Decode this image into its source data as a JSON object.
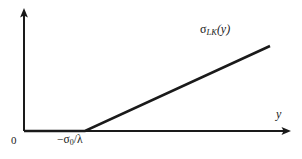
{
  "figure": {
    "background_color": "#ffffff",
    "stroke_color": "#1a1a1a",
    "width": 302,
    "height": 159
  },
  "labels": {
    "origin": "0",
    "threshold_minus": "−σ",
    "threshold_sub": "0",
    "threshold_tail": "/λ",
    "axis_horizontal": "y",
    "curve_sigma": "σ",
    "curve_sub": "LK",
    "curve_arg": "(y)"
  },
  "chart_data": {
    "type": "line",
    "title": "",
    "xlabel": "y",
    "ylabel": "",
    "annotations": [
      {
        "text": "σ_LK(y)",
        "x": 218,
        "y": 31,
        "role": "curve-label"
      },
      {
        "text": "0",
        "x": 14,
        "y": 140,
        "role": "origin-tick"
      },
      {
        "text": "−σ_0/λ",
        "x": 76,
        "y": 141,
        "role": "x-intercept-tick"
      }
    ],
    "axes": {
      "origin_px": [
        24,
        131
      ],
      "x_axis_end_px": [
        290,
        131
      ],
      "y_axis_end_px": [
        24,
        10
      ],
      "arrows": [
        "x-axis-right",
        "y-axis-up"
      ],
      "grid": false,
      "legend": null
    },
    "series": [
      {
        "name": "σ_LK(y)",
        "type": "piecewise-linear",
        "description": "Zero for y below the threshold −σ₀/λ, then increasing linearly with positive slope.",
        "points_px": [
          [
            24,
            131
          ],
          [
            85,
            131
          ],
          [
            270,
            46
          ]
        ],
        "breakpoint_label": "−σ₀/λ",
        "slope_sign": "positive",
        "left_branch_value": 0
      }
    ]
  }
}
